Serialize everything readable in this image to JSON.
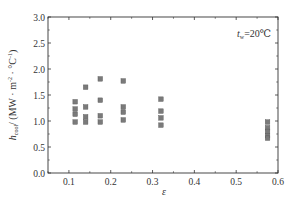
{
  "chart_data": {
    "type": "scatter",
    "title": "",
    "xlabel": "ε",
    "ylabel": "h_cool / (MW · m⁻² · °C⁻¹)",
    "ylabel_parts": {
      "symbol": "h",
      "subscript": "cool",
      "units": "/ (MW · m",
      "exp1": "-2",
      "mid": " · °C",
      "exp2": "-1",
      "close": ")"
    },
    "xlim": [
      0.05,
      0.6
    ],
    "ylim": [
      0.0,
      3.0
    ],
    "x_ticks": [
      0.1,
      0.2,
      0.3,
      0.4,
      0.5,
      0.6
    ],
    "x_tick_labels": [
      "0.1",
      "0.2",
      "0.3",
      "0.4",
      "0.5",
      "0.6"
    ],
    "y_ticks": [
      0.0,
      0.5,
      1.0,
      1.5,
      2.0,
      2.5,
      3.0
    ],
    "y_tick_labels": [
      "0.0",
      "0.5",
      "1.0",
      "1.5",
      "2.0",
      "2.5",
      "3.0"
    ],
    "grid": false,
    "annotation": {
      "text_symbol": "t",
      "text_sub": "w",
      "text_rest": "=20℃"
    },
    "marker": "square",
    "marker_color": "#7a7a7a",
    "series": [
      {
        "name": "t_w=20°C",
        "points": [
          {
            "x": 0.115,
            "y": 1.37
          },
          {
            "x": 0.115,
            "y": 1.23
          },
          {
            "x": 0.115,
            "y": 1.13
          },
          {
            "x": 0.115,
            "y": 0.98
          },
          {
            "x": 0.14,
            "y": 1.65
          },
          {
            "x": 0.14,
            "y": 1.27
          },
          {
            "x": 0.14,
            "y": 1.08
          },
          {
            "x": 0.14,
            "y": 0.98
          },
          {
            "x": 0.175,
            "y": 1.81
          },
          {
            "x": 0.175,
            "y": 1.4
          },
          {
            "x": 0.175,
            "y": 1.1
          },
          {
            "x": 0.175,
            "y": 0.98
          },
          {
            "x": 0.23,
            "y": 1.77
          },
          {
            "x": 0.23,
            "y": 1.27
          },
          {
            "x": 0.23,
            "y": 1.17
          },
          {
            "x": 0.23,
            "y": 1.02
          },
          {
            "x": 0.32,
            "y": 1.42
          },
          {
            "x": 0.32,
            "y": 1.19
          },
          {
            "x": 0.32,
            "y": 1.06
          },
          {
            "x": 0.32,
            "y": 0.92
          },
          {
            "x": 0.575,
            "y": 0.98
          },
          {
            "x": 0.575,
            "y": 0.87
          },
          {
            "x": 0.575,
            "y": 0.8
          },
          {
            "x": 0.575,
            "y": 0.72
          },
          {
            "x": 0.575,
            "y": 0.67
          }
        ]
      }
    ]
  }
}
